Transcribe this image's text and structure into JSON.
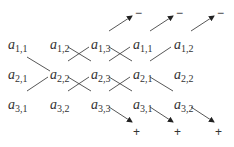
{
  "diagram": {
    "entries": [
      {
        "row": 1,
        "col": 1,
        "base": "a",
        "sub": "1,1",
        "x": 8,
        "y": 38
      },
      {
        "row": 1,
        "col": 2,
        "base": "a",
        "sub": "1,2",
        "x": 50,
        "y": 38
      },
      {
        "row": 1,
        "col": 3,
        "base": "a",
        "sub": "1,3",
        "x": 91,
        "y": 38
      },
      {
        "row": 1,
        "col": 4,
        "base": "a",
        "sub": "1,1",
        "x": 133,
        "y": 38
      },
      {
        "row": 1,
        "col": 5,
        "base": "a",
        "sub": "1,2",
        "x": 174,
        "y": 38
      },
      {
        "row": 2,
        "col": 1,
        "base": "a",
        "sub": "2,1",
        "x": 8,
        "y": 68
      },
      {
        "row": 2,
        "col": 2,
        "base": "a",
        "sub": "2,2",
        "x": 50,
        "y": 68
      },
      {
        "row": 2,
        "col": 3,
        "base": "a",
        "sub": "2,3",
        "x": 91,
        "y": 68
      },
      {
        "row": 2,
        "col": 4,
        "base": "a",
        "sub": "2,1",
        "x": 133,
        "y": 68
      },
      {
        "row": 2,
        "col": 5,
        "base": "a",
        "sub": "2,2",
        "x": 174,
        "y": 68
      },
      {
        "row": 3,
        "col": 1,
        "base": "a",
        "sub": "3,1",
        "x": 8,
        "y": 98
      },
      {
        "row": 3,
        "col": 2,
        "base": "a",
        "sub": "3,2",
        "x": 50,
        "y": 98
      },
      {
        "row": 3,
        "col": 3,
        "base": "a",
        "sub": "3,3",
        "x": 91,
        "y": 98
      },
      {
        "row": 3,
        "col": 4,
        "base": "a",
        "sub": "3,1",
        "x": 133,
        "y": 98
      },
      {
        "row": 3,
        "col": 5,
        "base": "a",
        "sub": "3,2",
        "x": 174,
        "y": 98
      }
    ],
    "minus_signs": [
      {
        "label": "−",
        "x": 135,
        "y": 7
      },
      {
        "label": "−",
        "x": 176,
        "y": 7
      },
      {
        "label": "−",
        "x": 217,
        "y": 7
      }
    ],
    "plus_signs": [
      {
        "label": "+",
        "x": 133,
        "y": 126
      },
      {
        "label": "+",
        "x": 174,
        "y": 126
      },
      {
        "label": "+",
        "x": 215,
        "y": 126
      }
    ],
    "positive_diagonals": [
      [
        "a1,1",
        "a2,2",
        "a3,3",
        "+"
      ],
      [
        "a1,2",
        "a2,3",
        "a3,1",
        "+"
      ],
      [
        "a1,3",
        "a2,1",
        "a3,2",
        "+"
      ]
    ],
    "negative_diagonals": [
      [
        "a3,1",
        "a2,2",
        "a1,3",
        "−"
      ],
      [
        "a3,2",
        "a2,3",
        "a1,1",
        "−"
      ],
      [
        "a3,3",
        "a2,1",
        "a1,2",
        "−"
      ]
    ],
    "line_color": "#333333"
  }
}
